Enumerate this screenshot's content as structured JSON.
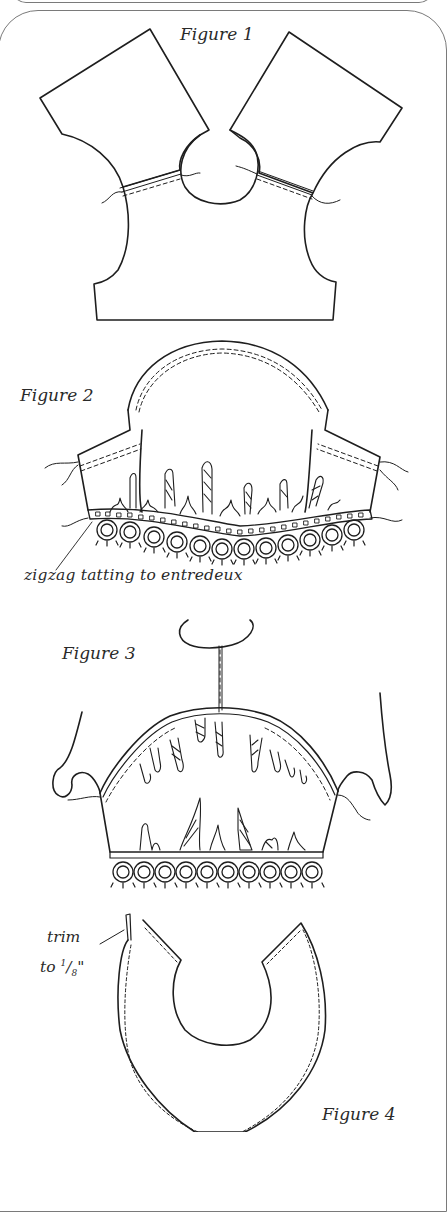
{
  "figures": [
    {
      "id": 1,
      "label": "Figure 1",
      "description": "Two yoke/sleeve pattern pieces joined with neckline circle; seams stitched"
    },
    {
      "id": 2,
      "label": "Figure 2",
      "description": "Sleeve with gathered edge attached to entredeux and tatting",
      "callout": "zigzag tatting to entredeux"
    },
    {
      "id": 3,
      "label": "Figure 3",
      "description": "Sleeve set into armhole with gathers and tatting edge"
    },
    {
      "id": 4,
      "label": "Figure 4",
      "description": "Collar piece with stitching line",
      "callout_line1": "trim",
      "callout_line2_prefix": "to ",
      "callout_fraction_num": "1",
      "callout_fraction_sep": "/",
      "callout_fraction_den": "8",
      "callout_unit": "\""
    }
  ],
  "colors": {
    "ink": "#1e1e1e",
    "frame": "#7a7a7a",
    "paper": "#ffffff"
  }
}
